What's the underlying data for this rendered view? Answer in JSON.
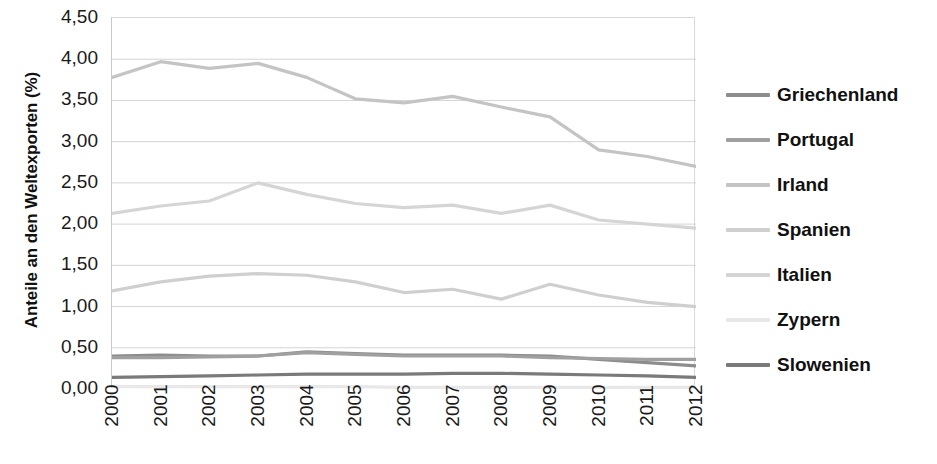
{
  "chart_data": {
    "type": "line",
    "title": "",
    "xlabel": "",
    "ylabel": "Anteile an den Weltexporten (%)",
    "x": [
      "2000",
      "2001",
      "2002",
      "2003",
      "2004",
      "2005",
      "2006",
      "2007",
      "2008",
      "2009",
      "2010",
      "2011",
      "2012"
    ],
    "ylim": [
      0.0,
      4.5
    ],
    "ytick_labels": [
      "0,00",
      "0,50",
      "1,00",
      "1,50",
      "2,00",
      "2,50",
      "3,00",
      "3,50",
      "4,00",
      "4,50"
    ],
    "ytick_values": [
      0.0,
      0.5,
      1.0,
      1.5,
      2.0,
      2.5,
      3.0,
      3.5,
      4.0,
      4.5
    ],
    "grid": true,
    "grid_axis": "y",
    "legend_position": "right",
    "series": [
      {
        "name": "Griechenland",
        "color": "#8d8d8d",
        "values": [
          0.4,
          0.41,
          0.4,
          0.4,
          0.45,
          0.43,
          0.41,
          0.41,
          0.41,
          0.4,
          0.36,
          0.32,
          0.28
        ]
      },
      {
        "name": "Portugal",
        "color": "#a0a0a0",
        "values": [
          0.38,
          0.38,
          0.39,
          0.4,
          0.44,
          0.42,
          0.4,
          0.4,
          0.4,
          0.38,
          0.37,
          0.36,
          0.36
        ]
      },
      {
        "name": "Irland",
        "color": "#c4c4c4",
        "values": [
          3.78,
          3.97,
          3.89,
          3.95,
          3.78,
          3.52,
          3.47,
          3.55,
          3.42,
          3.3,
          2.9,
          2.82,
          2.7
        ]
      },
      {
        "name": "Spanien",
        "color": "#cfcfcf",
        "values": [
          1.19,
          1.3,
          1.37,
          1.4,
          1.38,
          1.3,
          1.17,
          1.21,
          1.09,
          1.27,
          1.14,
          1.05,
          1.0
        ]
      },
      {
        "name": "Italien",
        "color": "#d5d5d5",
        "values": [
          2.13,
          2.22,
          2.28,
          2.5,
          2.36,
          2.25,
          2.2,
          2.23,
          2.13,
          2.23,
          2.05,
          2.0,
          1.95
        ]
      },
      {
        "name": "Zypern",
        "color": "#e8e8e8",
        "values": [
          0.03,
          0.03,
          0.03,
          0.03,
          0.03,
          0.03,
          0.02,
          0.02,
          0.02,
          0.02,
          0.02,
          0.02,
          0.02
        ]
      },
      {
        "name": "Slowenien",
        "color": "#7a7a7a",
        "values": [
          0.14,
          0.15,
          0.16,
          0.17,
          0.18,
          0.18,
          0.18,
          0.19,
          0.19,
          0.18,
          0.17,
          0.16,
          0.14
        ]
      }
    ]
  },
  "axis": {
    "y_title": "Anteile an den Weltexporten (%)"
  },
  "colors": {
    "grid": "#d4d4d4",
    "axis_line": "#c8c8c8",
    "text": "#1a1a1a"
  }
}
